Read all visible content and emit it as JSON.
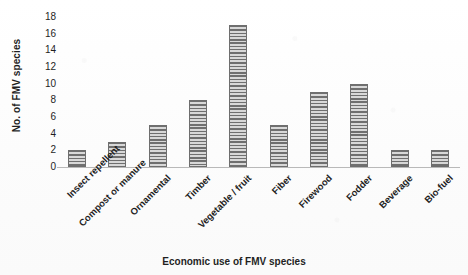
{
  "chart_data": {
    "type": "bar",
    "title": "",
    "xlabel": "Economic use of FMV species",
    "ylabel": "No. of FMV species",
    "categories": [
      "Insect repellent",
      "Compost or manure",
      "Ornamental",
      "Timber",
      "Vegetable / fruit",
      "Fiber",
      "Firewood",
      "Fodder",
      "Beverage",
      "Bio-fuel"
    ],
    "values": [
      2,
      3,
      5,
      8,
      17,
      5,
      9,
      10,
      2,
      2
    ],
    "ylim": [
      0,
      18
    ],
    "yticks": [
      0,
      2,
      4,
      6,
      8,
      10,
      12,
      14,
      16,
      18
    ],
    "ytick_labels": [
      "0",
      "2",
      "4",
      "6",
      "8",
      "10",
      "12",
      "14",
      "16",
      "18"
    ],
    "grid": false,
    "legend": false,
    "bar_fill": "#c9c9c9",
    "bar_hatch_color": "#6f6f6f",
    "bar_edge_color": "#6e6e6e",
    "axis_color": "#b9b9b9",
    "background": "#fdfdfd",
    "text_color": "#1f1f1f"
  }
}
